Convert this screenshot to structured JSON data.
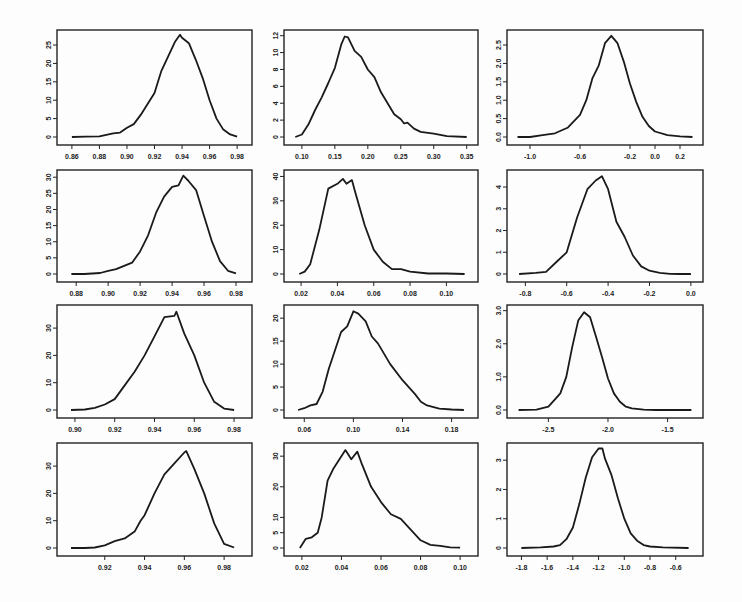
{
  "chart_data": [
    {
      "type": "line",
      "panel": "r1c1",
      "xticks": [
        "0.86",
        "0.88",
        "0.90",
        "0.92",
        "0.94",
        "0.96",
        "0.98"
      ],
      "xlim": [
        0.855,
        0.985
      ],
      "yticks": [
        "0",
        "5",
        "10",
        "15",
        "20",
        "25"
      ],
      "ylim": [
        0,
        28
      ],
      "x": [
        0.86,
        0.87,
        0.88,
        0.89,
        0.895,
        0.9,
        0.905,
        0.91,
        0.915,
        0.92,
        0.925,
        0.93,
        0.935,
        0.9385,
        0.94,
        0.945,
        0.95,
        0.955,
        0.96,
        0.965,
        0.97,
        0.975,
        0.98
      ],
      "y": [
        0,
        0.1,
        0.2,
        1,
        1.2,
        2.5,
        3.5,
        6,
        9,
        12,
        18,
        22,
        26,
        27.8,
        27,
        25.5,
        21,
        16,
        10,
        5,
        2,
        0.7,
        0.1
      ]
    },
    {
      "type": "line",
      "panel": "r1c2",
      "xticks": [
        "0.10",
        "0.15",
        "0.20",
        "0.25",
        "0.30",
        "0.35"
      ],
      "xlim": [
        0.085,
        0.355
      ],
      "yticks": [
        "0",
        "2",
        "4",
        "6",
        "8",
        "10",
        "12"
      ],
      "ylim": [
        0,
        12.2
      ],
      "x": [
        0.09,
        0.1,
        0.11,
        0.12,
        0.13,
        0.14,
        0.15,
        0.16,
        0.165,
        0.17,
        0.18,
        0.19,
        0.2,
        0.21,
        0.22,
        0.23,
        0.24,
        0.25,
        0.255,
        0.26,
        0.27,
        0.28,
        0.3,
        0.32,
        0.35
      ],
      "y": [
        0,
        0.3,
        1.5,
        3.2,
        4.7,
        6.4,
        8.2,
        11,
        11.9,
        11.8,
        10.2,
        9.5,
        8,
        7.1,
        5.3,
        4,
        2.7,
        2.1,
        1.6,
        1.7,
        1,
        0.6,
        0.4,
        0.1,
        0
      ]
    },
    {
      "type": "line",
      "panel": "r1c3",
      "xticks": [
        "-1.0",
        "-0.6",
        "-0.2",
        "0.0",
        "0.2"
      ],
      "xlim": [
        -1.12,
        0.32
      ],
      "yticks": [
        "0.0",
        "0.5",
        "1.0",
        "1.5",
        "2.0",
        "2.5"
      ],
      "ylim": [
        0,
        2.8
      ],
      "x": [
        -1.1,
        -1.0,
        -0.9,
        -0.8,
        -0.7,
        -0.6,
        -0.55,
        -0.5,
        -0.45,
        -0.4,
        -0.35,
        -0.3,
        -0.25,
        -0.2,
        -0.15,
        -0.1,
        -0.05,
        0.0,
        0.1,
        0.2,
        0.3
      ],
      "y": [
        0,
        0,
        0.05,
        0.1,
        0.25,
        0.6,
        1.0,
        1.6,
        1.95,
        2.55,
        2.75,
        2.55,
        2.05,
        1.45,
        0.95,
        0.55,
        0.3,
        0.15,
        0.05,
        0.02,
        0
      ]
    },
    {
      "type": "line",
      "panel": "r2c1",
      "xticks": [
        "0.88",
        "0.90",
        "0.92",
        "0.94",
        "0.96",
        "0.98"
      ],
      "xlim": [
        0.873,
        0.985
      ],
      "yticks": [
        "0",
        "5",
        "10",
        "15",
        "20",
        "25",
        "30"
      ],
      "ylim": [
        0,
        31
      ],
      "x": [
        0.877,
        0.885,
        0.895,
        0.9,
        0.905,
        0.91,
        0.915,
        0.92,
        0.925,
        0.93,
        0.935,
        0.94,
        0.944,
        0.947,
        0.95,
        0.955,
        0.96,
        0.965,
        0.97,
        0.975,
        0.98
      ],
      "y": [
        0,
        0,
        0.3,
        1,
        1.5,
        2.5,
        3.5,
        7,
        12,
        19,
        24,
        27,
        27.5,
        30.5,
        29,
        26,
        18,
        10,
        4,
        1,
        0.2
      ]
    },
    {
      "type": "line",
      "panel": "r2c2",
      "xticks": [
        "0.02",
        "0.04",
        "0.06",
        "0.08",
        "0.10"
      ],
      "xlim": [
        0.015,
        0.113
      ],
      "yticks": [
        "0",
        "10",
        "20",
        "30",
        "40"
      ],
      "ylim": [
        0,
        41
      ],
      "x": [
        0.019,
        0.022,
        0.025,
        0.03,
        0.035,
        0.04,
        0.043,
        0.045,
        0.048,
        0.05,
        0.055,
        0.06,
        0.065,
        0.07,
        0.075,
        0.08,
        0.09,
        0.1,
        0.11
      ],
      "y": [
        0,
        1,
        4,
        18,
        35,
        37,
        39,
        37,
        38.5,
        33,
        20,
        10,
        5,
        2,
        2,
        1,
        0.2,
        0.2,
        0
      ]
    },
    {
      "type": "line",
      "panel": "r2c3",
      "xticks": [
        "-0.8",
        "-0.6",
        "-0.4",
        "-0.2",
        "0.0"
      ],
      "xlim": [
        -0.85,
        0.02
      ],
      "yticks": [
        "0",
        "1",
        "2",
        "3",
        "4"
      ],
      "ylim": [
        0,
        4.6
      ],
      "x": [
        -0.83,
        -0.75,
        -0.7,
        -0.65,
        -0.6,
        -0.55,
        -0.5,
        -0.46,
        -0.43,
        -0.4,
        -0.36,
        -0.32,
        -0.28,
        -0.24,
        -0.2,
        -0.15,
        -0.1,
        -0.05,
        0.0
      ],
      "y": [
        0,
        0.05,
        0.1,
        0.55,
        1.0,
        2.6,
        3.9,
        4.3,
        4.5,
        3.9,
        2.4,
        1.7,
        0.85,
        0.35,
        0.15,
        0.05,
        0.01,
        0,
        0
      ]
    },
    {
      "type": "line",
      "panel": "r3c1",
      "xticks": [
        "0.90",
        "0.92",
        "0.94",
        "0.96",
        "0.98"
      ],
      "xlim": [
        0.895,
        0.985
      ],
      "yticks": [
        "0",
        "10",
        "20",
        "30"
      ],
      "ylim": [
        0,
        37
      ],
      "x": [
        0.898,
        0.905,
        0.91,
        0.915,
        0.92,
        0.925,
        0.93,
        0.935,
        0.94,
        0.945,
        0.95,
        0.951,
        0.955,
        0.96,
        0.965,
        0.97,
        0.975,
        0.98
      ],
      "y": [
        0,
        0.2,
        0.8,
        2,
        4,
        9,
        14,
        20,
        27,
        34,
        34.5,
        36,
        28,
        20,
        10,
        3,
        0.5,
        0
      ]
    },
    {
      "type": "line",
      "panel": "r3c2",
      "xticks": [
        "0.06",
        "0.10",
        "0.14",
        "0.18"
      ],
      "xlim": [
        0.05,
        0.195
      ],
      "yticks": [
        "0",
        "5",
        "10",
        "15",
        "20"
      ],
      "ylim": [
        0,
        22
      ],
      "x": [
        0.055,
        0.06,
        0.065,
        0.07,
        0.075,
        0.08,
        0.085,
        0.09,
        0.095,
        0.1,
        0.104,
        0.11,
        0.115,
        0.12,
        0.13,
        0.14,
        0.15,
        0.155,
        0.16,
        0.17,
        0.18,
        0.19
      ],
      "y": [
        0,
        0.4,
        1,
        1.3,
        4,
        9,
        13,
        17,
        18.2,
        21.5,
        21,
        19.3,
        16,
        14.5,
        10,
        6.5,
        3.5,
        1.8,
        1,
        0.3,
        0.1,
        0
      ]
    },
    {
      "type": "line",
      "panel": "r3c3",
      "xticks": [
        "-2.5",
        "-2.0",
        "-1.5"
      ],
      "xlim": [
        -2.78,
        -1.27
      ],
      "yticks": [
        "0.0",
        "1.0",
        "2.0",
        "3.0"
      ],
      "ylim": [
        0,
        3.05
      ],
      "x": [
        -2.75,
        -2.6,
        -2.5,
        -2.45,
        -2.4,
        -2.35,
        -2.3,
        -2.25,
        -2.2,
        -2.15,
        -2.1,
        -2.05,
        -2.0,
        -1.95,
        -1.9,
        -1.85,
        -1.8,
        -1.7,
        -1.6,
        -1.5,
        -1.3
      ],
      "y": [
        0,
        0.01,
        0.1,
        0.3,
        0.5,
        1.0,
        1.9,
        2.7,
        2.95,
        2.8,
        2.2,
        1.6,
        0.95,
        0.5,
        0.25,
        0.1,
        0.05,
        0.01,
        0,
        0,
        0
      ]
    },
    {
      "type": "line",
      "panel": "r4c1",
      "xticks": [
        "0.92",
        "0.94",
        "0.96",
        "0.98"
      ],
      "xlim": [
        0.9,
        0.99
      ],
      "yticks": [
        "0",
        "10",
        "20",
        "30"
      ],
      "ylim": [
        0,
        37
      ],
      "x": [
        0.903,
        0.91,
        0.915,
        0.92,
        0.925,
        0.93,
        0.935,
        0.938,
        0.94,
        0.945,
        0.95,
        0.955,
        0.96,
        0.961,
        0.965,
        0.97,
        0.975,
        0.98,
        0.985
      ],
      "y": [
        0,
        0,
        0.2,
        1,
        2.5,
        3.5,
        6,
        10,
        12,
        20,
        27,
        31,
        35,
        35.5,
        29,
        20,
        9,
        1.5,
        0.2
      ]
    },
    {
      "type": "line",
      "panel": "r4c2",
      "xticks": [
        "0.02",
        "0.04",
        "0.06",
        "0.08",
        "0.10"
      ],
      "xlim": [
        0.015,
        0.105
      ],
      "yticks": [
        "0",
        "5",
        "10",
        "20",
        "30"
      ],
      "ylim": [
        0,
        33
      ],
      "x": [
        0.019,
        0.022,
        0.025,
        0.028,
        0.03,
        0.033,
        0.036,
        0.04,
        0.042,
        0.045,
        0.048,
        0.05,
        0.055,
        0.06,
        0.065,
        0.07,
        0.075,
        0.08,
        0.085,
        0.09,
        0.095,
        0.1
      ],
      "y": [
        0,
        3,
        3.5,
        5,
        10,
        22,
        26,
        30,
        32,
        29,
        31.5,
        28,
        20,
        15,
        11,
        9.5,
        6,
        2.5,
        1,
        0.7,
        0.2,
        0.1
      ]
    },
    {
      "type": "line",
      "panel": "r4c3",
      "xticks": [
        "-1.8",
        "-1.6",
        "-1.4",
        "-1.2",
        "-1.0",
        "-0.8",
        "-0.6"
      ],
      "xlim": [
        -1.85,
        -0.45
      ],
      "yticks": [
        "0",
        "1",
        "2",
        "3"
      ],
      "ylim": [
        0,
        3.45
      ],
      "x": [
        -1.8,
        -1.65,
        -1.55,
        -1.5,
        -1.45,
        -1.4,
        -1.35,
        -1.3,
        -1.25,
        -1.2,
        -1.17,
        -1.15,
        -1.1,
        -1.05,
        -1.0,
        -0.95,
        -0.9,
        -0.85,
        -0.8,
        -0.7,
        -0.5
      ],
      "y": [
        0,
        0.02,
        0.05,
        0.1,
        0.3,
        0.7,
        1.5,
        2.4,
        3.1,
        3.4,
        3.4,
        3.05,
        2.5,
        1.7,
        1.0,
        0.5,
        0.25,
        0.1,
        0.05,
        0.02,
        0
      ]
    }
  ]
}
